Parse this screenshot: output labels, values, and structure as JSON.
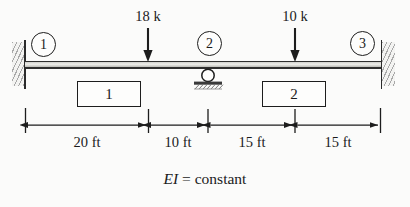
{
  "figure": {
    "caption_symbol": "EI",
    "caption_rest": " = constant",
    "caption_full": "EI = constant"
  },
  "nodes": [
    {
      "id": "1",
      "label": "1",
      "support": "fixed",
      "x": 25
    },
    {
      "id": "2",
      "label": "2",
      "support": "roller",
      "x": 208
    },
    {
      "id": "3",
      "label": "3",
      "support": "fixed",
      "x": 381
    }
  ],
  "members": [
    {
      "label": "1",
      "name": "member-1"
    },
    {
      "label": "2",
      "name": "member-2"
    }
  ],
  "loads": [
    {
      "label": "18 k",
      "magnitude": 18,
      "unit": "k",
      "direction": "down",
      "x": 148
    },
    {
      "label": "10 k",
      "magnitude": 10,
      "unit": "k",
      "direction": "down",
      "x": 295
    }
  ],
  "dimensions": [
    {
      "label": "20 ft",
      "value": 20,
      "unit": "ft"
    },
    {
      "label": "10 ft",
      "value": 10,
      "unit": "ft"
    },
    {
      "label": "15 ft",
      "value": 15,
      "unit": "ft"
    },
    {
      "label": "15 ft",
      "value": 15,
      "unit": "ft"
    }
  ],
  "colors": {
    "ink": "#1d1d1d",
    "beam_fill": "#d8d8d4",
    "hatch": "#9a9a9a",
    "paper": "#fbfbfa"
  }
}
